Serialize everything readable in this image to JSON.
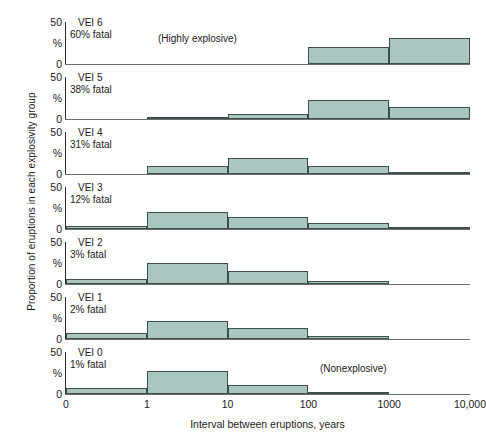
{
  "chart_data": {
    "type": "bar",
    "title": "",
    "xlabel": "Interval between eruptions, years",
    "ylabel": "Proportion of eruptions in each explosivity group",
    "ylim": [
      0,
      50
    ],
    "ytick_labels": [
      "50",
      "%",
      "0"
    ],
    "yunit": "%",
    "grid": false,
    "legend": null,
    "x_axis_scale": "log",
    "x_tick_labels": [
      "0",
      "1",
      "10",
      "100",
      "1000",
      "10,000"
    ],
    "x_bins": [
      {
        "label": "0–1",
        "from": "0",
        "to": "1"
      },
      {
        "label": "1–10",
        "from": "1",
        "to": "10"
      },
      {
        "label": "10–100",
        "from": "10",
        "to": "100"
      },
      {
        "label": "100–1000",
        "from": "100",
        "to": "1000"
      },
      {
        "label": "1000–10,000",
        "from": "1000",
        "to": "10,000"
      }
    ],
    "panels": [
      {
        "name": "VEI 6",
        "fatal": "60% fatal",
        "note": "(Highly explosive)",
        "values": [
          0,
          0,
          0,
          20,
          31
        ]
      },
      {
        "name": "VEI 5",
        "fatal": "38% fatal",
        "note": "",
        "values": [
          0,
          2,
          6,
          23,
          14
        ]
      },
      {
        "name": "VEI 4",
        "fatal": "31% fatal",
        "note": "",
        "values": [
          0,
          9,
          19,
          9,
          1
        ]
      },
      {
        "name": "VEI 3",
        "fatal": "12% fatal",
        "note": "",
        "values": [
          3,
          20,
          14,
          7,
          1
        ]
      },
      {
        "name": "VEI 2",
        "fatal": "3% fatal",
        "note": "",
        "values": [
          6,
          25,
          15,
          3,
          0
        ]
      },
      {
        "name": "VEI 1",
        "fatal": "2% fatal",
        "note": "",
        "values": [
          7,
          22,
          13,
          3,
          0
        ]
      },
      {
        "name": "VEI 0",
        "fatal": "1% fatal",
        "note": "(Nonexplosive)",
        "values": [
          7,
          27,
          11,
          2,
          0
        ]
      }
    ],
    "colors": {
      "bar_fill": "#a9c6c0",
      "bar_stroke": "#3d4f4c",
      "axis": "#2b2b2b",
      "text": "#1a1a1a",
      "background": "#ffffff"
    }
  }
}
